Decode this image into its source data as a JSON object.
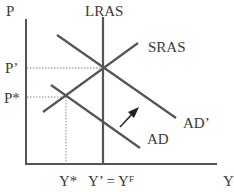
{
  "diagram": {
    "axes": {
      "y_label": "P",
      "x_label": "Y"
    },
    "curves": {
      "lras": "LRAS",
      "sras": "SRAS",
      "ad": "AD",
      "ad_prime": "AD’"
    },
    "price_levels": {
      "p_prime": "P’",
      "p_star": "P*"
    },
    "output_levels": {
      "y_star": "Y*",
      "y_prime": "Y’ = Y",
      "y_f_sup": "F"
    },
    "arrow": "shift-right-arrow",
    "colors": {
      "line": "#555555",
      "dotted": "#888888",
      "text": "#3a3a3a"
    }
  }
}
